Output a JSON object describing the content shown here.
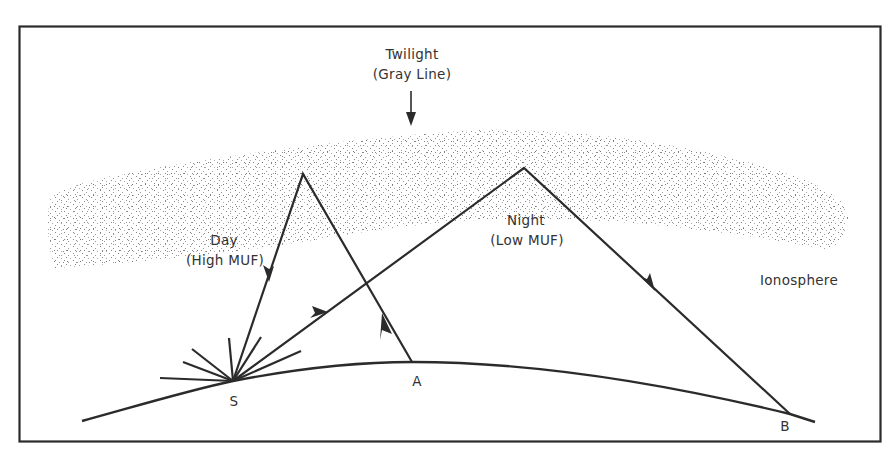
{
  "diagram": {
    "colors": {
      "ink": "#2b2b2b",
      "stipple": "#7a7a7a",
      "background": "#ffffff"
    },
    "labels": {
      "twilight_line1": "Twilight",
      "twilight_line2": "(Gray Line)",
      "day_line1": "Day",
      "day_line2": "(High MUF)",
      "night_line1": "Night",
      "night_line2": "(Low MUF)",
      "ionosphere": "Ionosphere",
      "point_s": "S",
      "point_a": "A",
      "point_b": "B"
    },
    "points": {
      "S": [
        233,
        381
      ],
      "A": [
        412,
        362
      ],
      "B": [
        790,
        414
      ],
      "day_apex": [
        303,
        174
      ],
      "night_apex": [
        524,
        168
      ]
    },
    "paths": [
      {
        "name": "day-path",
        "from": "A",
        "via": "day_apex",
        "to": "S",
        "description": "Signal from A reflects off dayside ionosphere down to S"
      },
      {
        "name": "night-path",
        "from": "S",
        "via": "night_apex",
        "to": "B",
        "description": "Signal from S reflects off nightside ionosphere down to B"
      }
    ]
  }
}
